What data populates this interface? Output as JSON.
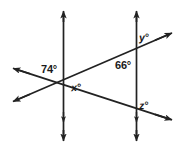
{
  "figure": {
    "type": "geometry-diagram",
    "background_color": "#ffffff",
    "stroke_color": "#222222",
    "label_color": "#1a1a1a",
    "labels": {
      "left_upper_angle": "74°",
      "left_lower_angle": "x°",
      "right_inner_angle": "66°",
      "right_upper_angle": "y°",
      "right_lower_angle": "z°"
    },
    "geometry": {
      "left_vertical_line": {
        "x": 63,
        "y_top": 10,
        "y_bottom": 142
      },
      "right_vertical_line": {
        "x": 136,
        "y_top": 10,
        "y_bottom": 142
      },
      "upper_transversal": {
        "x1": 12,
        "y1": 102,
        "x2": 172,
        "y2": 33
      },
      "lower_transversal": {
        "x1": 12,
        "y1": 68,
        "x2": 172,
        "y2": 120
      },
      "intersection_left": {
        "x": 63,
        "y": 85
      },
      "intersection_right_upper": {
        "x": 136,
        "y": 51
      },
      "intersection_right_lower": {
        "x": 136,
        "y": 111
      }
    }
  }
}
